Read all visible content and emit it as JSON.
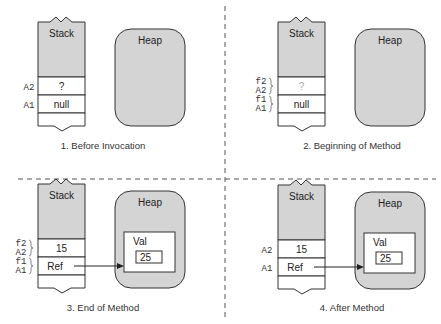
{
  "colors": {
    "fill_gray": "#d4d4d4",
    "stroke": "#333333",
    "divider": "#555555",
    "faded_text": "#aaaaaa"
  },
  "panels": [
    {
      "caption": "1. Before Invocation",
      "stack": {
        "title": "Stack",
        "cells": [
          {
            "labels": [
              "A2"
            ],
            "value": "?"
          },
          {
            "labels": [
              "A1"
            ],
            "value": "null"
          }
        ]
      },
      "heap": {
        "title": "Heap"
      }
    },
    {
      "caption": "2. Beginning of Method",
      "stack": {
        "title": "Stack",
        "cells": [
          {
            "labels": [
              "f2",
              "A2"
            ],
            "value": "?",
            "faded": true
          },
          {
            "labels": [
              "f1",
              "A1"
            ],
            "value": "null"
          }
        ]
      },
      "heap": {
        "title": "Heap"
      }
    },
    {
      "caption": "3. End of Method",
      "stack": {
        "title": "Stack",
        "cells": [
          {
            "labels": [
              "f2",
              "A2"
            ],
            "value": "15"
          },
          {
            "labels": [
              "f1",
              "A1"
            ],
            "value": "Ref"
          }
        ]
      },
      "heap": {
        "title": "Heap",
        "object": {
          "title": "Val",
          "field": "25"
        }
      }
    },
    {
      "caption": "4. After Method",
      "stack": {
        "title": "Stack",
        "cells": [
          {
            "labels": [
              "A2"
            ],
            "value": "15"
          },
          {
            "labels": [
              "A1"
            ],
            "value": "Ref"
          }
        ]
      },
      "heap": {
        "title": "Heap",
        "object": {
          "title": "Val",
          "field": "25"
        }
      }
    }
  ]
}
